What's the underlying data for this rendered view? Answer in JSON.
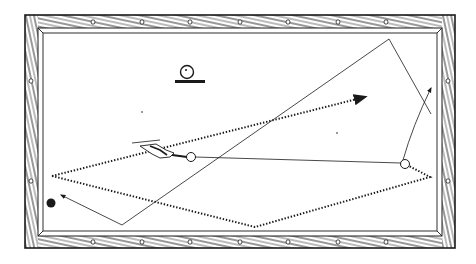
{
  "diagram": {
    "title": "",
    "colors": {
      "ink": "#1a1a1a",
      "cloth": "#ffffff",
      "background": "#ffffff"
    },
    "table": {
      "outer_frame": {
        "x": 25,
        "y": 15,
        "w": 430,
        "h": 233
      },
      "inner_cloth": {
        "x": 42,
        "y": 32,
        "w": 396,
        "h": 200
      },
      "diamonds_top": [
        93,
        142,
        190,
        240,
        288,
        338,
        386
      ],
      "diamonds_bottom": [
        93,
        142,
        190,
        240,
        288,
        338,
        386
      ],
      "diamonds_left": [
        81,
        181
      ],
      "diamonds_right": [
        81,
        181
      ]
    },
    "balls": [
      {
        "name": "cue-ball",
        "cx": 191,
        "cy": 157,
        "r": 4.5,
        "fill": "#ffffff"
      },
      {
        "name": "object-ball",
        "cx": 405,
        "cy": 164,
        "r": 4.5,
        "fill": "#ffffff"
      },
      {
        "name": "black-ball",
        "cx": 51,
        "cy": 203,
        "r": 4.5,
        "fill": "#1a1a1a"
      }
    ],
    "legend_symbol": {
      "name": "ball-on-line-symbol",
      "cx": 187,
      "cy": 72,
      "r": 6.5
    },
    "paths": {
      "cue_line": [
        [
          160,
          155
        ],
        [
          191,
          157
        ]
      ],
      "object_ball_path": [
        [
          195,
          157
        ],
        [
          405,
          163
        ]
      ],
      "solid_path": [
        [
          405,
          163
        ],
        [
          420,
          120
        ],
        [
          431,
          88
        ]
      ],
      "solid_polygon": [
        [
          431,
          114
        ],
        [
          389,
          39
        ],
        [
          122,
          225
        ],
        [
          61,
          195
        ]
      ],
      "dotted_path_a": [
        [
          52,
          176
        ],
        [
          365,
          97
        ]
      ],
      "dotted_path_b": [
        [
          52,
          176
        ],
        [
          255,
          227
        ],
        [
          430,
          177
        ],
        [
          409,
          166
        ]
      ]
    },
    "annotations": []
  }
}
